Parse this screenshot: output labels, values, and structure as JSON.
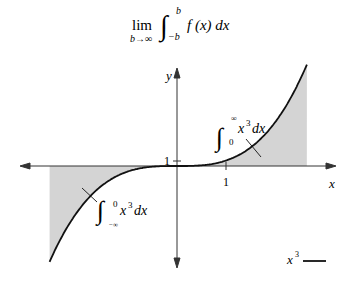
{
  "title_formula": {
    "lim": "lim",
    "lim_sub": "b→∞",
    "upper": "b",
    "lower": "−b",
    "integrand": "f (x) dx"
  },
  "axes": {
    "x_label": "x",
    "y_label": "y",
    "x_tick_label": "1",
    "y_tick_label": "1"
  },
  "annotations": {
    "right_integral": {
      "upper": "∞",
      "lower": "0",
      "integrand": "x",
      "power": "3",
      "dx": "dx"
    },
    "left_integral": {
      "upper": "0",
      "lower": "−∞",
      "integrand": "x",
      "power": "3",
      "dx": "dx"
    }
  },
  "legend": {
    "label": "x",
    "power": "3"
  },
  "colors": {
    "curve": "#111111",
    "shade": "#d4d4d4",
    "axis": "#333333"
  },
  "chart_data": {
    "type": "area",
    "function": "x^3",
    "x_range": [
      -2.6,
      2.65
    ],
    "xlabel": "x",
    "ylabel": "y",
    "ticks": {
      "x": [
        1
      ],
      "y": [
        1
      ]
    },
    "shaded_regions": [
      {
        "from": -2.6,
        "to": 0,
        "label": "∫_{−∞}^{0} x^3 dx"
      },
      {
        "from": 0,
        "to": 2.65,
        "label": "∫_{0}^{∞} x^3 dx"
      }
    ],
    "legend": [
      "x^3"
    ],
    "grid": false
  }
}
